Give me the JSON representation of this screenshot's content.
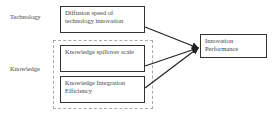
{
  "diagram": {
    "categories": [
      {
        "label": "Technology"
      },
      {
        "label": "Knowledge"
      }
    ],
    "factors": [
      {
        "text": "Diffusion speed of technology innovation"
      },
      {
        "text": "Knowledge spillover scale"
      },
      {
        "text": "Knowledge Integration Efficiency"
      }
    ],
    "outcome": {
      "text": "Innovation Performance"
    },
    "arrow_signs": [
      "+",
      "+",
      "+"
    ]
  }
}
